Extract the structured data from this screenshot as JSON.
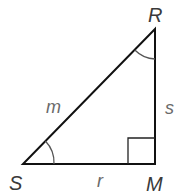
{
  "diagram": {
    "type": "right-triangle",
    "vertices": {
      "S": {
        "label": "S",
        "x": 23,
        "y": 164
      },
      "M": {
        "label": "M",
        "x": 155,
        "y": 164
      },
      "R": {
        "label": "R",
        "x": 155,
        "y": 29
      }
    },
    "sides": {
      "m": {
        "label": "m",
        "from": "S",
        "to": "R",
        "role": "hypotenuse"
      },
      "r": {
        "label": "r",
        "from": "S",
        "to": "M"
      },
      "s": {
        "label": "s",
        "from": "M",
        "to": "R"
      }
    },
    "right_angle_at": "M",
    "angle_marks": [
      "S",
      "R"
    ],
    "colors": {
      "line": "#111111",
      "arc": "#555555",
      "vertex_label": "#3a3a3a",
      "side_label": "#6a6a6a"
    }
  }
}
